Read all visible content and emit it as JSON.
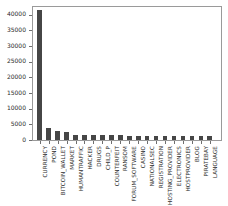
{
  "chart_data": {
    "type": "bar",
    "title": "",
    "xlabel": "",
    "ylabel": "",
    "ylim": [
      0,
      42500
    ],
    "grid": false,
    "legend": null,
    "bar_color": "#464646",
    "axis_color": "#9a9a9a",
    "yticks": [
      0,
      5000,
      10000,
      15000,
      20000,
      25000,
      30000,
      35000,
      40000
    ],
    "ytick_labels": [
      "0",
      "5000",
      "10000",
      "15000",
      "20000",
      "25000",
      "30000",
      "35000",
      "40000"
    ],
    "categories": [
      "CURRENCY",
      "POND",
      "BITCOIN_WALLET",
      "MARKET",
      "HUMANTRAFFIC",
      "HACKER",
      "DRUGS",
      "CHILD_P",
      "COUNTERFEIT",
      "RANSOM",
      "FORUM_SOFTWARE",
      "CASINO",
      "NATIONALSEC",
      "REGISTRATION",
      "HOSTING_PROVIDER",
      "ELECTRONICS",
      "HOSTPROVIDER",
      "BLOG",
      "PIRATEBAY",
      "LANGUAGE"
    ],
    "values": [
      41700,
      3800,
      3000,
      2600,
      1600,
      1600,
      1500,
      1500,
      1500,
      1500,
      1400,
      1400,
      1400,
      1300,
      1300,
      1300,
      1300,
      1300,
      1300,
      1200
    ]
  }
}
